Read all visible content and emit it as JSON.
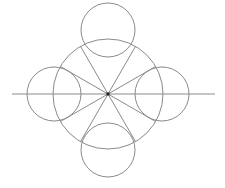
{
  "diagram": {
    "type": "geometric-construction",
    "colors": {
      "stroke": "#8a8a8a",
      "center": "#222222",
      "background": "#ffffff"
    },
    "center": {
      "x": 108,
      "y": 94
    },
    "main_circle": {
      "cx": 108,
      "cy": 94,
      "r": 55
    },
    "lobe_circles": [
      {
        "name": "top",
        "cx": 108,
        "cy": 30,
        "r": 27
      },
      {
        "name": "bottom",
        "cx": 108,
        "cy": 150,
        "r": 27
      },
      {
        "name": "left",
        "cx": 54,
        "cy": 94,
        "r": 27
      },
      {
        "name": "right",
        "cx": 162,
        "cy": 94,
        "r": 27
      }
    ],
    "axis_line": {
      "x1": 12,
      "y1": 94,
      "x2": 215,
      "y2": 94
    },
    "radial_line_angles_deg": [
      30,
      60,
      120,
      150,
      210,
      240,
      300,
      330
    ],
    "radial_line_length": 55
  }
}
